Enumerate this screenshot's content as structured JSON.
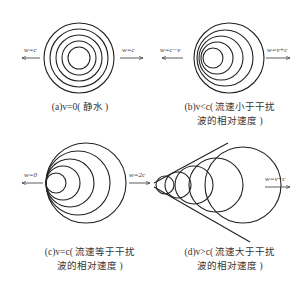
{
  "panels": [
    {
      "id": "a",
      "caption_lines": [
        "(a)v=0( 静水 )"
      ],
      "left_label": "w=c",
      "right_label": "w=c",
      "circles": [
        {
          "cx": 79,
          "cy": 58,
          "r": 11
        },
        {
          "cx": 79,
          "cy": 58,
          "r": 17
        },
        {
          "cx": 79,
          "cy": 58,
          "r": 23
        },
        {
          "cx": 79,
          "cy": 58,
          "r": 29
        },
        {
          "cx": 79,
          "cy": 58,
          "r": 35
        }
      ]
    },
    {
      "id": "b",
      "caption_lines": [
        "(b)v<c( 流速小于干扰",
        "波的相对速度 )"
      ],
      "left_label": "w=c−v",
      "right_label": "w=v+c",
      "circles": [
        {
          "cx": 213,
          "cy": 58,
          "r": 10
        },
        {
          "cx": 217,
          "cy": 58,
          "r": 16
        },
        {
          "cx": 221,
          "cy": 58,
          "r": 22
        },
        {
          "cx": 225,
          "cy": 58,
          "r": 28
        },
        {
          "cx": 229,
          "cy": 58,
          "r": 35
        }
      ]
    },
    {
      "id": "c",
      "caption_lines": [
        "(c)v=c( 流速等于干扰",
        "波的相对速度 )"
      ],
      "left_label": "w=0",
      "right_label": "w=2c",
      "circles": [
        {
          "cx": 56,
          "cy": 183,
          "r": 10
        },
        {
          "cx": 63,
          "cy": 183,
          "r": 17
        },
        {
          "cx": 70,
          "cy": 183,
          "r": 24
        },
        {
          "cx": 78,
          "cy": 183,
          "r": 32
        },
        {
          "cx": 86,
          "cy": 183,
          "r": 40
        }
      ]
    },
    {
      "id": "d",
      "caption_lines": [
        "(d)v>c( 流速大于干扰",
        "波的相对速度 )"
      ],
      "left_label": "",
      "right_label": "w=v+c",
      "circles": [
        {
          "cx": 165,
          "cy": 185,
          "r": 9
        },
        {
          "cx": 178,
          "cy": 185,
          "r": 13
        },
        {
          "cx": 194,
          "cy": 185,
          "r": 19
        },
        {
          "cx": 216,
          "cy": 185,
          "r": 27
        },
        {
          "cx": 243,
          "cy": 185,
          "r": 38
        }
      ]
    }
  ],
  "colors": {
    "stroke": "#222222",
    "text": "#333333",
    "background": "#ffffff"
  }
}
